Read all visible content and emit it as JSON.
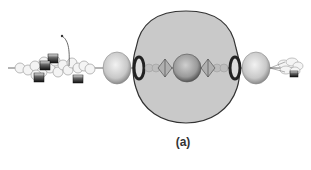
{
  "figure": {
    "caption": "(a)"
  },
  "colors": {
    "background": "#ffffff",
    "envelope_fill": "#c9c9c9",
    "envelope_stroke": "#333333",
    "sphere_fill": "#d8d8d8",
    "bead_stroke": "#aaaaaa",
    "block_dark": "#1a1a1a",
    "axis": "#444444"
  },
  "elements": {
    "envelope": "large rounded diamond envelope",
    "central_sphere": "central sphere",
    "left_outer_sphere": "left outer sphere",
    "right_outer_sphere": "right outer sphere",
    "left_ring": "left dark ring",
    "right_ring": "right dark ring",
    "left_diamond": "left wireframe diamond",
    "right_diamond": "right wireframe diamond",
    "left_bead_chain": "left coiled bead chain with dark blocks",
    "right_bead_chain": "right bead cluster with dark block",
    "pointer_arrow": "curved pointer line"
  }
}
